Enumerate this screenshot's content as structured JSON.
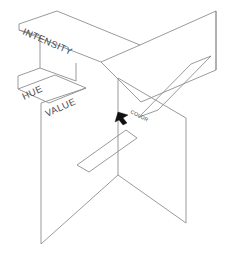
{
  "diagram": {
    "background_color": "#ffffff",
    "line_color": "#8e8e8e",
    "label_color": "#4a4a4a",
    "marker_color": "#111111",
    "labels": {
      "intensity": "INTENSITY",
      "hue": "HUE",
      "value": "VALUE",
      "color": "COLOR"
    },
    "marker": {
      "name": "color-point-marker",
      "shape": "arrow",
      "x": 124,
      "y": 117
    },
    "planes": [
      {
        "name": "upper-left-plane",
        "label": "INTENSITY",
        "points": "21,24 57,12 60,12 139,45 139,49 103,62 100,62 21,30"
      },
      {
        "name": "upper-right-plane",
        "label": "",
        "points": "139,45 215,11 216,70 140,101"
      },
      {
        "name": "lower-left-plane",
        "label": "HUE",
        "points": "18,89 55,75 86,88 49,102"
      },
      {
        "name": "front-vertical-plane",
        "label": "VALUE",
        "points": "41,101 41,244 118,175 118,124"
      }
    ],
    "slots": [
      {
        "name": "upper-right-slot",
        "points": "190,64 211,56 157,110 138,117"
      },
      {
        "name": "lower-center-slot",
        "points": "126,130 137,137 89,172 77,165"
      }
    ]
  }
}
